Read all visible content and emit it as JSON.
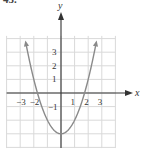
{
  "problem_label": "45.",
  "chart_data": {
    "type": "line",
    "title": "",
    "function": "y = x^2 - 3",
    "xlabel": "x",
    "ylabel": "y",
    "xlim": [
      -4,
      4
    ],
    "ylim": [
      -4,
      4
    ],
    "grid": true,
    "x_tick_labels": [
      "−3",
      "−2",
      "1",
      "2",
      "3"
    ],
    "y_tick_labels": [
      "3",
      "2",
      "1",
      "−1"
    ],
    "series": [
      {
        "name": "parabola",
        "x": [
          -2.6,
          -2,
          -1.7,
          -1,
          0,
          1,
          1.7,
          2,
          2.6
        ],
        "y": [
          3.76,
          1,
          0,
          -2,
          -3,
          -2,
          0,
          1,
          3.76
        ]
      }
    ],
    "vertex": [
      0,
      -3
    ],
    "colors": {
      "curve": "#8a8a8a",
      "grid": "#d9d9d9",
      "axis": "#333333"
    }
  }
}
